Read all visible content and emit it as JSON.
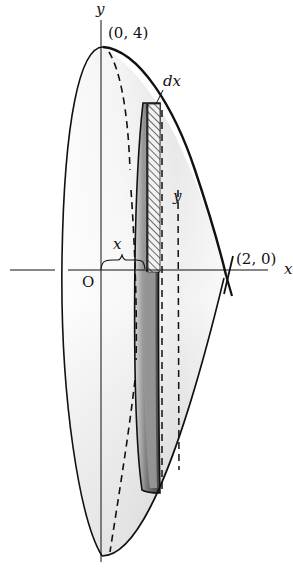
{
  "diagram": {
    "axes": {
      "x_label": "x",
      "y_label": "y",
      "origin_label": "O"
    },
    "points": [
      {
        "label": "(0, 4)"
      },
      {
        "label": "(2, 0)"
      }
    ],
    "annotations": {
      "strip_width": "dx",
      "strip_height": "y",
      "radius": "x"
    },
    "colors": {
      "outline": "#111111",
      "solid_fill_light": "#f4f4f4",
      "solid_fill_mid": "#cfcfcf",
      "shell_dark": "#555555",
      "hatch": "#222222"
    }
  }
}
